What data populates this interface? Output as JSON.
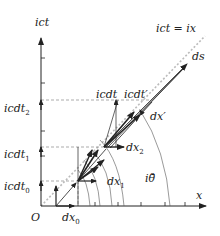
{
  "figure": {
    "axes": {
      "vertical_label": "ict",
      "horizontal_label": "x",
      "origin_label": "O",
      "diagonal_label": "ict = ix"
    },
    "vertical_labels": [
      {
        "base": "icdt",
        "sub": "2"
      },
      {
        "base": "icdt",
        "sub": "1"
      },
      {
        "base": "icdt",
        "sub": "0"
      }
    ],
    "inner_labels": {
      "icdt": "icdt",
      "icdt_prime": "icdt′",
      "ds": "ds",
      "dx_prime": "dx′",
      "dx2_base": "dx",
      "dx2_sub": "2",
      "dx1_base": "dx",
      "dx1_sub": "1",
      "dx0_base": "dx",
      "dx0_sub": "0",
      "angle": "iθ̄"
    },
    "colors": {
      "line": "#222222",
      "dashed": "#888888",
      "diagonal": "#bbbbbb"
    }
  }
}
